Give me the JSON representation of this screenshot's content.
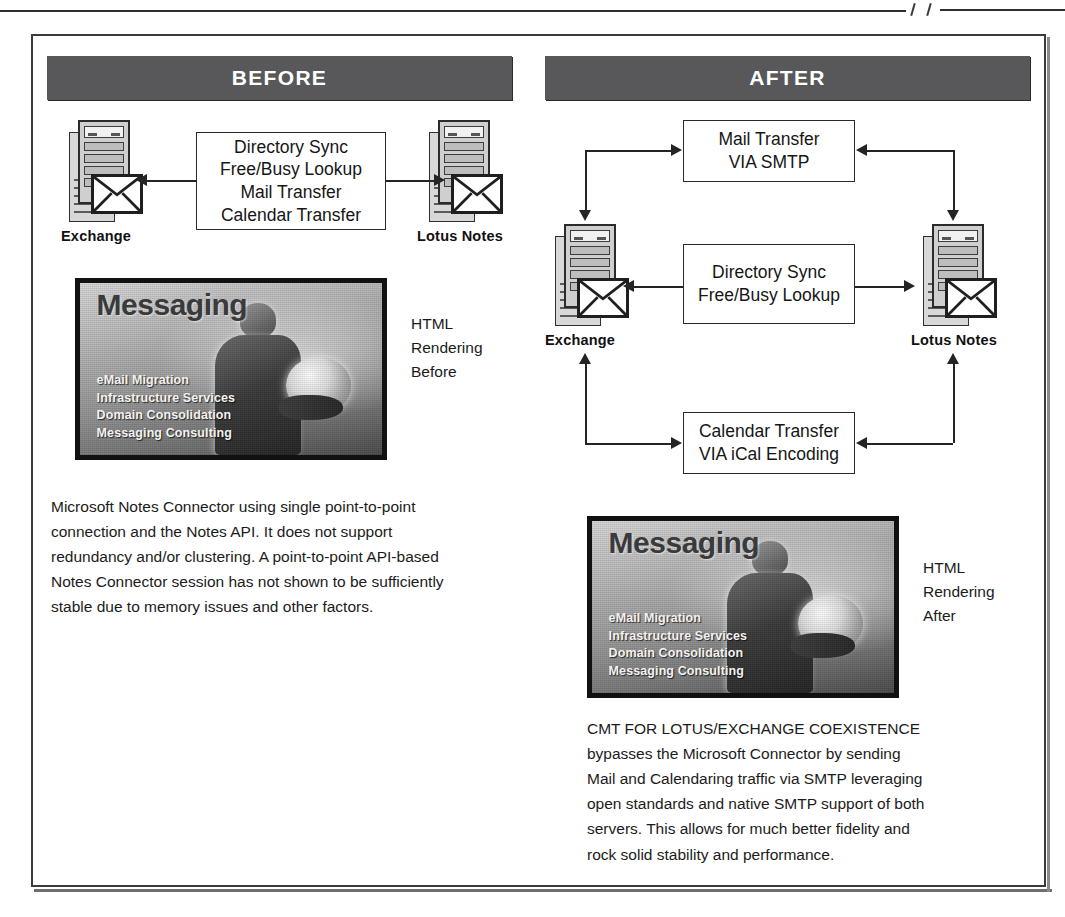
{
  "figure": {
    "headers": {
      "before": "BEFORE",
      "after": "AFTER"
    }
  },
  "before": {
    "servers": {
      "left_label": "Exchange",
      "right_label": "Lotus Notes"
    },
    "flow_box": {
      "lines": [
        "Directory Sync",
        "Free/Busy Lookup",
        "Mail Transfer",
        "Calendar Transfer"
      ]
    },
    "poster": {
      "title": "Messaging",
      "bullets": [
        "eMail Migration",
        "Infrastructure Services",
        "Domain Consolidation",
        "Messaging Consulting"
      ]
    },
    "poster_caption": {
      "lines": [
        "HTML",
        "Rendering",
        "Before"
      ]
    },
    "paragraph": {
      "lines": [
        "Microsoft Notes Connector using single point-to-point",
        "connection and the Notes API. It does not support",
        "redundancy and/or clustering. A point-to-point API-based",
        "Notes Connector session has not shown to be sufficiently",
        "stable due to memory issues and other factors."
      ]
    }
  },
  "after": {
    "servers": {
      "left_label": "Exchange",
      "right_label": "Lotus Notes"
    },
    "flow_boxes": [
      {
        "lines": [
          "Mail Transfer",
          "VIA SMTP"
        ]
      },
      {
        "lines": [
          "Directory Sync",
          "Free/Busy Lookup"
        ]
      },
      {
        "lines": [
          "Calendar Transfer",
          "VIA iCal Encoding"
        ]
      }
    ],
    "poster": {
      "title": "Messaging",
      "bullets": [
        "eMail Migration",
        "Infrastructure Services",
        "Domain Consolidation",
        "Messaging Consulting"
      ]
    },
    "poster_caption": {
      "lines": [
        "HTML",
        "Rendering",
        "After"
      ]
    },
    "paragraph": {
      "lines": [
        "CMT FOR LOTUS/EXCHANGE COEXISTENCE",
        "bypasses the Microsoft Connector by sending",
        "Mail and Calendaring traffic via SMTP leveraging",
        "open standards and native SMTP support of both",
        "servers. This allows for much better fidelity and",
        "rock solid stability and performance."
      ]
    }
  },
  "colors": {
    "header_bar": "#58585a",
    "frame_border": "#3b3b3b",
    "line": "#242424",
    "text": "#1b1b1b"
  }
}
